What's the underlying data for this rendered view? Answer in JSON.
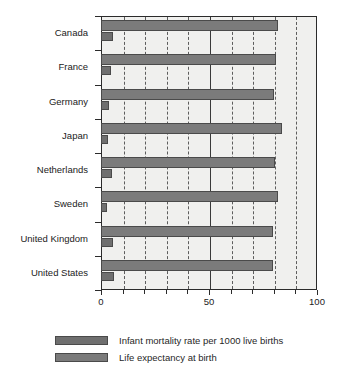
{
  "chart_data": {
    "type": "bar",
    "orientation": "horizontal",
    "title": "",
    "xlabel": "",
    "ylabel": "",
    "xlim": [
      0,
      100
    ],
    "xticks": [
      0,
      50,
      100
    ],
    "xticklabels": [
      "0",
      "50",
      "100"
    ],
    "minor_gridlines": [
      10,
      20,
      30,
      40,
      60,
      70,
      80,
      90
    ],
    "major_gridlines": [
      50
    ],
    "grid": true,
    "legend_position": "bottom",
    "categories": [
      "Canada",
      "France",
      "Germany",
      "Japan",
      "Netherlands",
      "Sweden",
      "United Kingdom",
      "United States"
    ],
    "series": [
      {
        "name": "Life expectancy at birth",
        "key": "life",
        "color": "#7b7b7b",
        "values": [
          81.9,
          81.0,
          80.0,
          83.7,
          80.5,
          82.0,
          79.5,
          79.8
        ]
      },
      {
        "name": "Infant mortality rate per 1000 live births",
        "key": "infant",
        "color": "#6f6f6f",
        "values": [
          5.6,
          4.4,
          3.9,
          3.3,
          5.1,
          2.8,
          5.5,
          6.0
        ]
      }
    ]
  },
  "legend": {
    "items": [
      {
        "label": "Infant mortality rate per 1000 live births",
        "key": "infant"
      },
      {
        "label": "Life expectancy at birth",
        "key": "life"
      }
    ]
  }
}
